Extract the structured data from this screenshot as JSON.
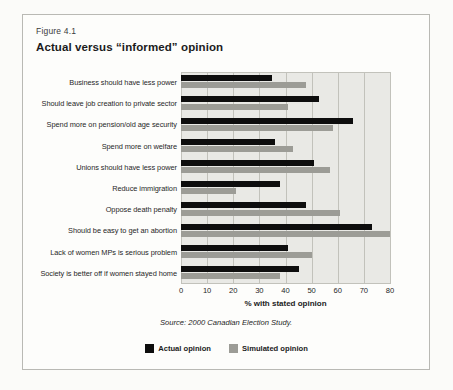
{
  "figure": {
    "number_label": "Figure 4.1",
    "title": "Actual versus “informed” opinion",
    "source": "Source: 2000 Canadian Election Study."
  },
  "legend": {
    "position": "bottom-center",
    "items": [
      {
        "label": "Actual opinion",
        "color": "#0d0d0d"
      },
      {
        "label": "Simulated opinion",
        "color": "#9c9c96"
      }
    ]
  },
  "chart_data": {
    "type": "bar",
    "orientation": "horizontal",
    "title": "Actual versus “informed” opinion",
    "subtitle": "Figure 4.1",
    "xlabel": "% with stated opinion",
    "ylabel": "",
    "xlim": [
      0,
      80
    ],
    "xticks": [
      0,
      10,
      20,
      30,
      40,
      50,
      60,
      70,
      80
    ],
    "grid": true,
    "grid_axis": "x",
    "categories": [
      "Business should have less power",
      "Should leave job creation to private sector",
      "Spend more on pension/old age security",
      "Spend more on welfare",
      "Unions should have less power",
      "Reduce immigration",
      "Oppose death penalty",
      "Should be easy to get an abortion",
      "Lack of women MPs is serious problem",
      "Society is better off if women stayed home"
    ],
    "series": [
      {
        "name": "Actual opinion",
        "color": "#0d0d0d",
        "values": [
          35,
          53,
          66,
          36,
          51,
          38,
          48,
          73,
          41,
          45
        ]
      },
      {
        "name": "Simulated opinion",
        "color": "#9c9c96",
        "values": [
          48,
          41,
          58,
          43,
          57,
          21,
          61,
          80,
          50,
          38
        ]
      }
    ]
  }
}
